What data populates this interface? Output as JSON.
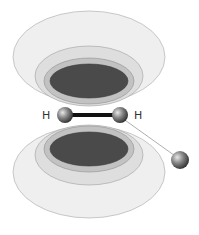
{
  "diagram": {
    "atoms": {
      "left_label": "H",
      "right_label": "H"
    },
    "colors": {
      "outer_shell": "#ededed",
      "shell_2": "#dcdcdc",
      "shell_3": "#bdbdbd",
      "core": "#4a4a4a",
      "stroke": "#9a9a9a",
      "bond": "#111111",
      "atom": "#6e6e6e"
    }
  }
}
